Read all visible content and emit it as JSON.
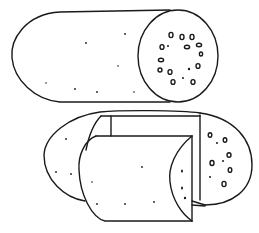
{
  "illustration": {
    "subject": "Line drawing of two sausages: a whole sausage with a cut end showing fat specks, and a sausage with a cut-away wedge section",
    "stroke_color": "#1a1a1a",
    "background": "#ffffff"
  }
}
